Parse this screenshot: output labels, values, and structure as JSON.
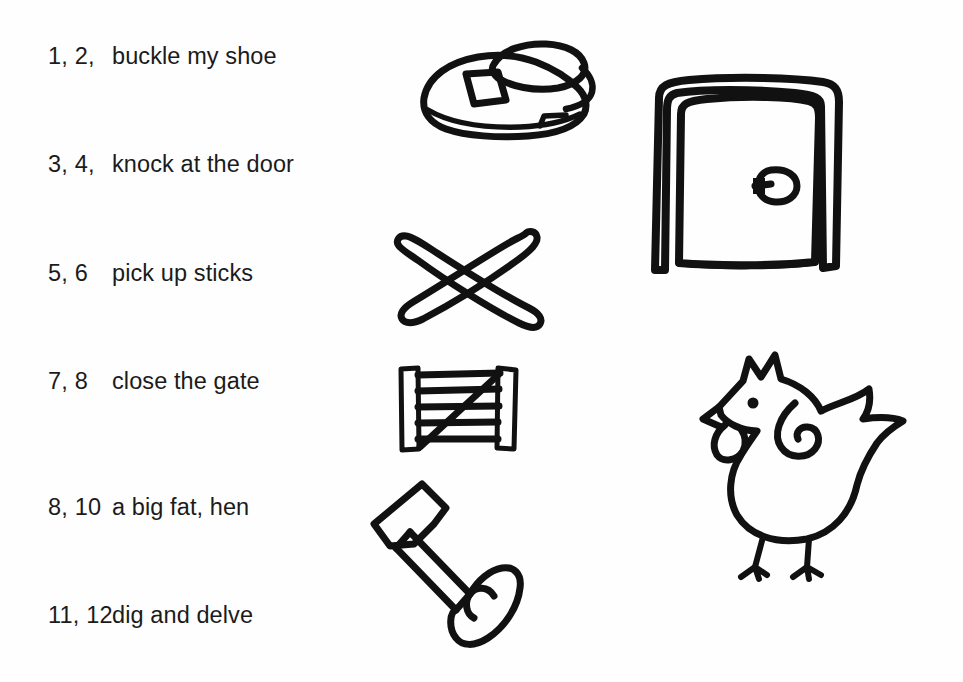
{
  "page": {
    "background_color": "#fefefe",
    "ink_color": "#111111"
  },
  "rhyme": {
    "rows": [
      {
        "number": "1, 2,",
        "phrase": "buckle my shoe",
        "illustration": "shoe"
      },
      {
        "number": "3, 4,",
        "phrase": "knock at the door",
        "illustration": "door"
      },
      {
        "number": "5, 6",
        "phrase": "pick up sticks",
        "illustration": "crossed-sticks"
      },
      {
        "number": "7, 8",
        "phrase": "close the gate",
        "illustration": "gate"
      },
      {
        "number": "8, 10",
        "phrase": "a big fat, hen",
        "illustration": "hen"
      },
      {
        "number": "11, 12",
        "phrase": "dig and delve",
        "illustration": "spade"
      }
    ]
  },
  "drawings": {
    "shoe": {
      "label": "shoe with buckle strap"
    },
    "door": {
      "label": "door in frame with round knob"
    },
    "crossed_sticks": {
      "label": "two sticks crossed in an X"
    },
    "gate": {
      "label": "five bar farm gate with diagonal brace"
    },
    "spade": {
      "label": "spade with T handle tilted diagonally"
    },
    "hen": {
      "label": "hen with comb, beak, wattle, spiral wing and two legs"
    }
  }
}
